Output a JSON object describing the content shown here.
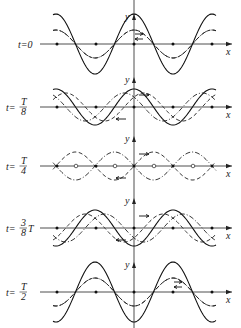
{
  "figure": {
    "axis_labels": {
      "x": "x",
      "y": "y"
    },
    "panels": [
      {
        "id": "t0",
        "label_prefix": "t=",
        "label_value": "0",
        "axis_y": 44,
        "standing_amp": 30,
        "wave_amp": 14,
        "phase_right": 0,
        "phase_left": 0
      },
      {
        "id": "t8",
        "label_prefix": "t=",
        "label_num": "T",
        "label_den": "8",
        "axis_y": 107,
        "standing_amp": 18,
        "wave_amp": 14,
        "phase_right": 0.125,
        "phase_left": -0.125
      },
      {
        "id": "t4",
        "label_prefix": "t=",
        "label_num": "T",
        "label_den": "4",
        "axis_y": 166,
        "standing_amp": 0,
        "wave_amp": 14,
        "phase_right": 0.25,
        "phase_left": -0.25
      },
      {
        "id": "t38",
        "label_prefix": "t=",
        "label_num": "3",
        "label_den": "8",
        "label_suffix": "T",
        "axis_y": 228,
        "standing_amp": -18,
        "wave_amp": 14,
        "phase_right": 0.375,
        "phase_left": -0.375
      },
      {
        "id": "t2",
        "label_prefix": "t=",
        "label_num": "T",
        "label_den": "2",
        "axis_y": 292,
        "standing_amp": -30,
        "wave_amp": 14,
        "phase_right": 0.5,
        "phase_left": -0.5
      }
    ],
    "origin_x": 134,
    "wavelength_px": 78,
    "x_start": 57,
    "x_end": 212,
    "marker_points_x": [
      57,
      96,
      134,
      173,
      212
    ],
    "colors": {
      "ink": "#111111",
      "background": "#ffffff"
    }
  }
}
